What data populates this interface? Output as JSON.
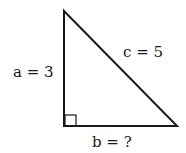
{
  "diagram": {
    "type": "right-triangle",
    "labels": {
      "side_a": "a = 3",
      "side_b": "b = ?",
      "side_c": "c = 5"
    },
    "colors": {
      "stroke": "#1a1a1a",
      "background": "#ffffff"
    }
  }
}
